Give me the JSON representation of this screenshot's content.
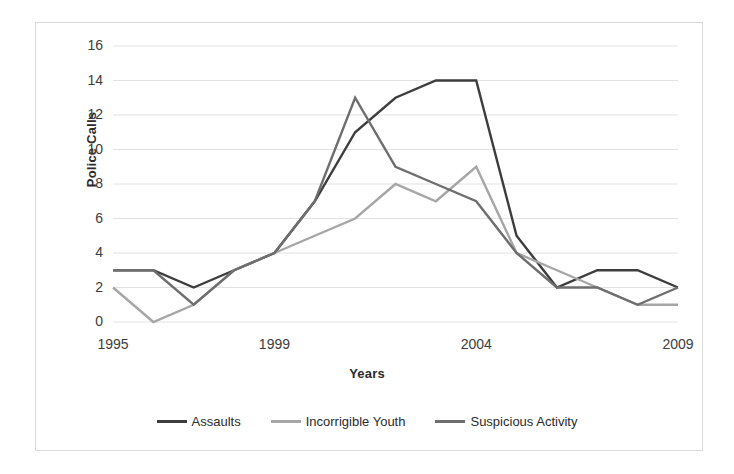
{
  "chart_data": {
    "type": "line",
    "title": "",
    "xlabel": "Years",
    "ylabel": "Police Calls",
    "x": [
      1995,
      1996,
      1997,
      1998,
      1999,
      2000,
      2001,
      2002,
      2003,
      2004,
      2005,
      2006,
      2007,
      2008,
      2009
    ],
    "xtick_labels": [
      "1995",
      "1999",
      "2004",
      "2009"
    ],
    "xtick_values": [
      1995,
      1999,
      2004,
      2009
    ],
    "ytick_labels": [
      "0",
      "2",
      "4",
      "6",
      "8",
      "10",
      "12",
      "14",
      "16"
    ],
    "ytick_values": [
      0,
      2,
      4,
      6,
      8,
      10,
      12,
      14,
      16
    ],
    "ylim": [
      0,
      16
    ],
    "xlim": [
      1995,
      2009
    ],
    "grid": true,
    "legend_position": "bottom",
    "series": [
      {
        "name": "Assaults",
        "color": "#3d3d3d",
        "values": [
          3,
          3,
          2,
          3,
          4,
          7,
          11,
          13,
          14,
          14,
          5,
          2,
          3,
          3,
          2
        ]
      },
      {
        "name": "Incorrigible Youth",
        "color": "#a6a6a6",
        "values": [
          2,
          0,
          1,
          3,
          4,
          5,
          6,
          8,
          7,
          9,
          4,
          3,
          2,
          1,
          1
        ]
      },
      {
        "name": "Suspicious Activity",
        "color": "#6e6e6e",
        "values": [
          3,
          3,
          1,
          3,
          4,
          7,
          13,
          9,
          8,
          7,
          4,
          2,
          2,
          1,
          2
        ]
      }
    ]
  },
  "colors": {
    "grid": "#e2e2e2",
    "frame_border": "#d9d9d9",
    "text": "#3c3c3c",
    "axis_title": "#2b2b2b",
    "background": "#ffffff"
  }
}
